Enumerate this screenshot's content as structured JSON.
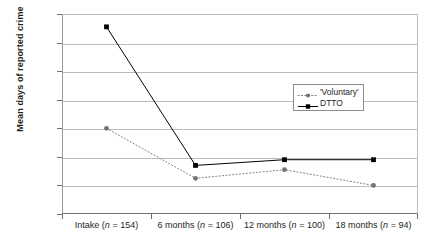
{
  "chart_data": {
    "type": "line",
    "title": "",
    "xlabel": "",
    "ylabel": "Mean days of reported crime",
    "ylim": [
      0,
      140
    ],
    "yticks": [
      0,
      20,
      40,
      60,
      80,
      100,
      120,
      140
    ],
    "grid": true,
    "legend_position": "inside-right",
    "categories": [
      "Intake (n = 154)",
      "6 months (n = 106)",
      "12 months (n = 100)",
      "18 months (n = 94)"
    ],
    "category_parts": [
      {
        "name": "Intake",
        "n": "154"
      },
      {
        "name": "6 months",
        "n": "106"
      },
      {
        "name": "12 months",
        "n": "100"
      },
      {
        "name": "18 months",
        "n": "94"
      }
    ],
    "series": [
      {
        "name": "'Voluntary'",
        "values": [
          60,
          25,
          31,
          20
        ],
        "line_style": "dotted",
        "marker": "circle",
        "color": "#808080"
      },
      {
        "name": "DTTO",
        "values": [
          131,
          34,
          38,
          38
        ],
        "line_style": "solid",
        "marker": "square",
        "color": "#000000"
      }
    ]
  },
  "legend": {
    "items": [
      {
        "label": "'Voluntary'"
      },
      {
        "label": "DTTO"
      }
    ]
  },
  "axis": {
    "y_title": "Mean days of reported crime",
    "y_tick_labels": [
      "140",
      "120",
      "100",
      "80",
      "60",
      "40",
      "20",
      "0"
    ]
  },
  "colors": {
    "grid": "#bdbdbd",
    "axis": "#6f6f6f",
    "voluntary": "#808080",
    "dtto": "#000000",
    "background": "#ffffff"
  }
}
